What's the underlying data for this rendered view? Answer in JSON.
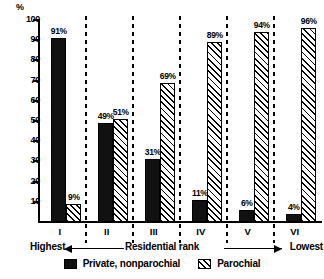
{
  "chart_data": {
    "type": "bar",
    "title": "",
    "xlabel": "Residential rank",
    "ylabel": "%",
    "ylim": [
      0,
      100
    ],
    "y_ticks": [
      100,
      90,
      80,
      70,
      60,
      50,
      40,
      30,
      20,
      10
    ],
    "grid": false,
    "legend_position": "bottom",
    "categories": [
      "I",
      "II",
      "III",
      "IV",
      "V",
      "VI"
    ],
    "axis_end_left": "Highest",
    "axis_end_right": "Lowest",
    "series": [
      {
        "name": "Private, nonparochial",
        "fill": "solid",
        "color": "#111111",
        "values": [
          91,
          49,
          31,
          11,
          6,
          4
        ],
        "labels": [
          "91%",
          "49%",
          "31%",
          "11%",
          "6%",
          "4%"
        ]
      },
      {
        "name": "Parochial",
        "fill": "hatch",
        "color": "#ffffff",
        "values": [
          9,
          51,
          69,
          89,
          94,
          96
        ],
        "labels": [
          "9%",
          "51%",
          "69%",
          "89%",
          "94%",
          "96%"
        ]
      }
    ]
  }
}
